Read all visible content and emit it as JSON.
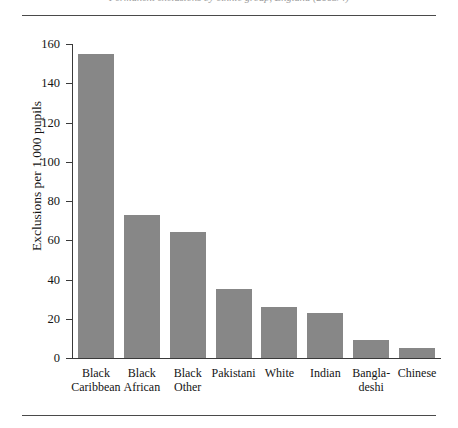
{
  "figure": {
    "caption_clipped": "Permanent exclusions by ethnic group, England (2003/4)",
    "rule_top": "horizontal-rule",
    "rule_bottom": "horizontal-rule"
  },
  "chart_data": {
    "type": "bar",
    "title": "",
    "xlabel": "",
    "ylabel": "Exclusions per 1,000 pupils",
    "ylim": [
      0,
      160
    ],
    "ytick_step": 20,
    "yticks": [
      0,
      20,
      40,
      60,
      80,
      100,
      120,
      140,
      160
    ],
    "ytick_labels": [
      "0",
      "20",
      "40",
      "60",
      "80",
      "100",
      "120",
      "140",
      "160"
    ],
    "grid": false,
    "legend": "none",
    "bar_color": "#878787",
    "categories": [
      "Black Caribbean",
      "Black African",
      "Black Other",
      "Pakistani",
      "White",
      "Indian",
      "Bangladeshi",
      "Chinese"
    ],
    "category_label_lines": [
      [
        "Black",
        "Caribbean"
      ],
      [
        "Black",
        "African"
      ],
      [
        "Black",
        "Other"
      ],
      [
        "Pakistani"
      ],
      [
        "White"
      ],
      [
        "Indian"
      ],
      [
        "Bangla-",
        "deshi"
      ],
      [
        "Chinese"
      ]
    ],
    "values": [
      155,
      73,
      64,
      35,
      26,
      23,
      9,
      5
    ]
  }
}
